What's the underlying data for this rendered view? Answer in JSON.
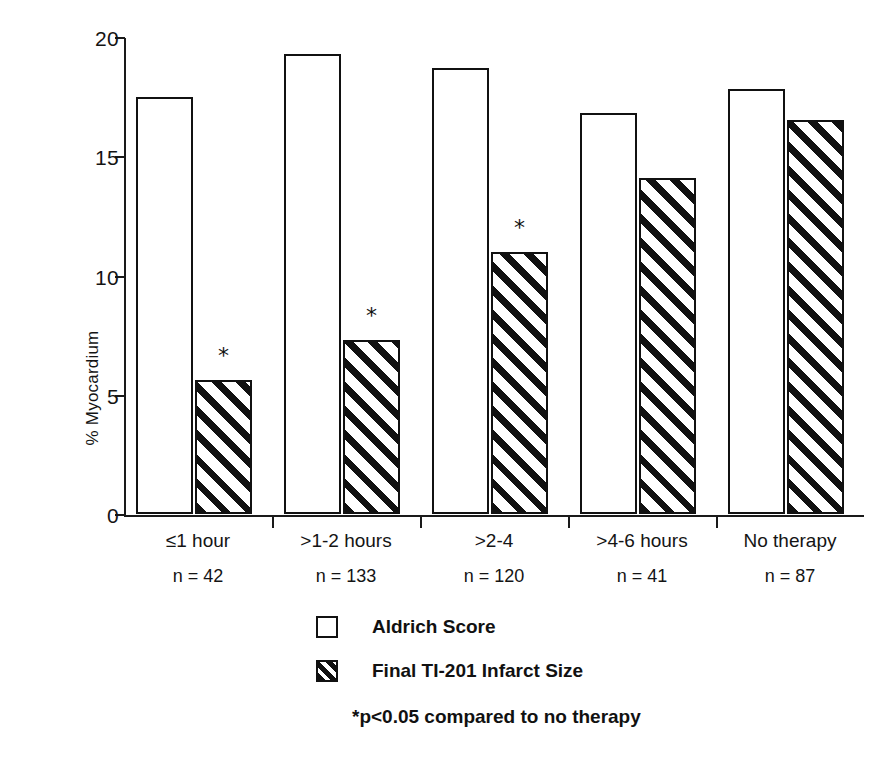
{
  "chart_data": {
    "type": "bar",
    "title": "",
    "xlabel": "",
    "ylabel": "% Myocardium",
    "ylim": [
      0,
      20
    ],
    "yticks": [
      0,
      5,
      10,
      15,
      20
    ],
    "ytick_labels": [
      "0",
      "5",
      "10",
      "15",
      "20"
    ],
    "grid": false,
    "legend_position": "below-axes-center",
    "categories": [
      "≤1 hour",
      ">1-2 hours",
      ">2-4",
      ">4-6 hours",
      "No therapy"
    ],
    "category_counts": [
      "n = 42",
      "n = 133",
      "n = 120",
      "n = 41",
      "n = 87"
    ],
    "series": [
      {
        "name": "Aldrich Score",
        "pattern": "open",
        "values": [
          17.5,
          19.3,
          18.7,
          16.8,
          17.8
        ]
      },
      {
        "name": "Final TI-201 Infarct Size",
        "pattern": "hatched",
        "values": [
          5.6,
          7.3,
          11.0,
          14.1,
          16.5
        ]
      }
    ],
    "annotations": [
      {
        "series": "Final TI-201 Infarct Size",
        "category": "≤1 hour",
        "marker": "*"
      },
      {
        "series": "Final TI-201 Infarct Size",
        "category": ">1-2 hours",
        "marker": "*"
      },
      {
        "series": "Final TI-201 Infarct Size",
        "category": ">2-4",
        "marker": "*"
      }
    ],
    "footnote": "*p<0.05 compared to no therapy"
  },
  "axes": {
    "y_title": "% Myocardium",
    "y_ticks": [
      {
        "label": "20",
        "value": 20
      },
      {
        "label": "15",
        "value": 15
      },
      {
        "label": "10",
        "value": 10
      },
      {
        "label": "5",
        "value": 5
      },
      {
        "label": "0",
        "value": 0
      }
    ]
  },
  "groups": [
    {
      "label": "≤1 hour",
      "count": "n = 42",
      "open_value": 17.5,
      "hatched_value": 5.6,
      "star": "*"
    },
    {
      "label": ">1-2 hours",
      "count": "n = 133",
      "open_value": 19.3,
      "hatched_value": 7.3,
      "star": "*"
    },
    {
      "label": ">2-4",
      "count": "n = 120",
      "open_value": 18.7,
      "hatched_value": 11.0,
      "star": "*"
    },
    {
      "label": ">4-6 hours",
      "count": "n = 41",
      "open_value": 16.8,
      "hatched_value": 14.1,
      "star": ""
    },
    {
      "label": "No therapy",
      "count": "n = 87",
      "open_value": 17.8,
      "hatched_value": 16.5,
      "star": ""
    }
  ],
  "legend": {
    "items": [
      {
        "label": "Aldrich Score",
        "pattern": "open"
      },
      {
        "label": "Final TI-201 Infarct Size",
        "pattern": "hatched"
      }
    ]
  },
  "footnote": "*p<0.05 compared to no therapy",
  "colors": {
    "ink": "#111111",
    "paper": "#ffffff"
  }
}
